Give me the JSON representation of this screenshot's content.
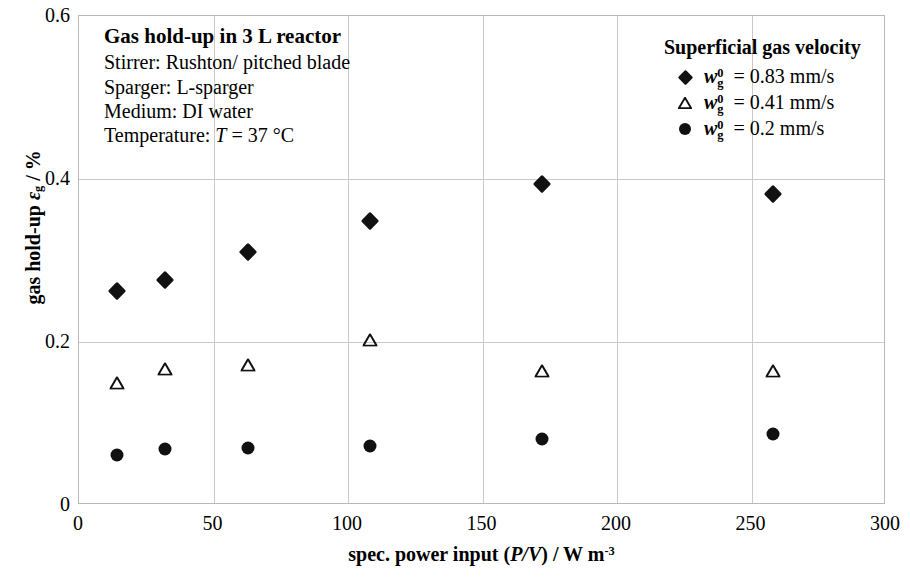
{
  "chart_data": {
    "type": "scatter",
    "title": "Gas hold-up in 3 L reactor",
    "xlabel": "spec. power input (P/V) / W m-3",
    "ylabel": "gas hold-up εg / %",
    "xlim": [
      0,
      300
    ],
    "ylim": [
      0,
      0.6
    ],
    "xticks": [
      "0",
      "50",
      "100",
      "150",
      "200",
      "250",
      "300"
    ],
    "yticks": [
      "0",
      "0.2",
      "0.4",
      "0.6"
    ],
    "xtick_values": [
      0,
      50,
      100,
      150,
      200,
      250,
      300
    ],
    "ytick_values": [
      0,
      0.2,
      0.4,
      0.6
    ],
    "grid": true,
    "legend_position": "top-right",
    "legend_title": "Superficial gas velocity",
    "series": [
      {
        "name": "wg0 = 0.83 mm/s",
        "marker": "filled-diamond",
        "color": "#111111",
        "x": [
          14,
          32,
          63,
          108,
          172,
          258
        ],
        "y": [
          0.262,
          0.276,
          0.31,
          0.349,
          0.394,
          0.381
        ]
      },
      {
        "name": "wg0 = 0.41 mm/s",
        "marker": "open-triangle",
        "color": "#111111",
        "x": [
          14,
          32,
          63,
          108,
          172,
          258
        ],
        "y": [
          0.15,
          0.167,
          0.172,
          0.203,
          0.165,
          0.164
        ]
      },
      {
        "name": "wg0 = 0.2 mm/s",
        "marker": "filled-circle",
        "color": "#111111",
        "x": [
          14,
          32,
          63,
          108,
          172,
          258
        ],
        "y": [
          0.061,
          0.069,
          0.07,
          0.072,
          0.081,
          0.087
        ]
      }
    ]
  },
  "annotation": {
    "title": "Gas hold-up in 3 L reactor",
    "line_stirrer": "Stirrer: Rushton/ pitched blade",
    "line_sparger": "Sparger: L-sparger",
    "line_medium": "Medium: DI water",
    "line_temperature_label": "Temperature: ",
    "line_temperature_symbol": "T",
    "line_temperature_value": " = 37 °C"
  },
  "legend": {
    "title": "Superficial gas velocity",
    "entries": [
      {
        "symbol": "w",
        "sup": "0",
        "sub": "g",
        "value": " = 0.83 mm/s",
        "marker": "filled-diamond"
      },
      {
        "symbol": "w",
        "sup": "0",
        "sub": "g",
        "value": " = 0.41 mm/s",
        "marker": "open-triangle"
      },
      {
        "symbol": "w",
        "sup": "0",
        "sub": "g",
        "value": " = 0.2 mm/s",
        "marker": "filled-circle"
      }
    ]
  },
  "axes": {
    "xlabel_prefix": "spec. power input (",
    "xlabel_italic": "P/V",
    "xlabel_mid": ") / W m",
    "xlabel_sup": "-3",
    "ylabel_prefix": "gas hold-up ",
    "ylabel_symbol": "ε",
    "ylabel_sub": "g",
    "ylabel_suffix": " / %"
  }
}
